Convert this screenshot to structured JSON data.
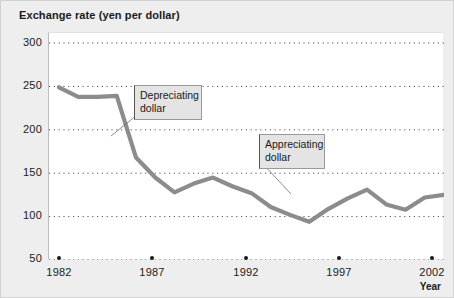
{
  "figure": {
    "title": "Exchange rate (yen per dollar)"
  },
  "axes": {
    "x_title": "Year",
    "y_ticks": [
      "300",
      "250",
      "200",
      "150",
      "100",
      "50"
    ],
    "x_ticks": [
      "1982",
      "1987",
      "1992",
      "1997",
      "2002"
    ]
  },
  "annotations": {
    "depreciating": "Depreciating\ndollar",
    "appreciating": "Appreciating\ndollar"
  },
  "colors": {
    "line": "#8c8c8c",
    "plot_background": "#ffffff",
    "figure_background": "#eeeeee",
    "grid": "#4d4d4d",
    "text": "#1a1a1a",
    "annotation_fill": "#e4e4e4"
  },
  "chart_data": {
    "type": "line",
    "title": "Exchange rate (yen per dollar)",
    "xlabel": "Year",
    "ylabel": "Exchange rate (yen per dollar)",
    "xlim": [
      1982,
      2002
    ],
    "ylim": [
      50,
      300
    ],
    "ytick_values": [
      300,
      250,
      200,
      150,
      100,
      50
    ],
    "xtick_values": [
      1982,
      1987,
      1992,
      1997,
      2002
    ],
    "grid": "horizontal-dotted",
    "legend": "none",
    "x": [
      1982,
      1983,
      1984,
      1985,
      1986,
      1987,
      1988,
      1989,
      1990,
      1991,
      1992,
      1993,
      1994,
      1995,
      1996,
      1997,
      1998,
      1999,
      2000,
      2001,
      2002
    ],
    "values": [
      249,
      238,
      238,
      239,
      168,
      145,
      128,
      138,
      145,
      135,
      127,
      111,
      102,
      94,
      109,
      121,
      131,
      114,
      108,
      122,
      125
    ],
    "series": [
      {
        "name": "Yen per dollar",
        "values": [
          249,
          238,
          238,
          239,
          168,
          145,
          128,
          138,
          145,
          135,
          127,
          111,
          102,
          94,
          109,
          121,
          131,
          114,
          108,
          122,
          125
        ]
      }
    ],
    "annotations": [
      {
        "text": "Depreciating dollar",
        "points_to_x": 1986,
        "points_to_y": 190
      },
      {
        "text": "Appreciating dollar",
        "points_to_x": 1996,
        "points_to_y": 104
      }
    ]
  }
}
